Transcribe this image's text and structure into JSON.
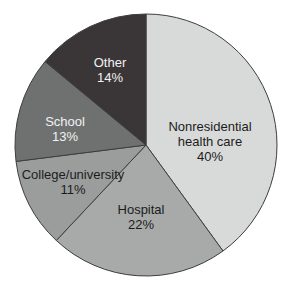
{
  "figure": {
    "kind": "pie-chart-figure",
    "background": "#ffffff"
  },
  "chart_data": {
    "type": "pie",
    "unit": "%",
    "direction": "clockwise",
    "start_angle_deg": 0,
    "legend": "none",
    "categories": [
      "Nonresidential health care",
      "Hospital",
      "College/university",
      "School",
      "Other"
    ],
    "values": [
      40,
      22,
      11,
      13,
      14
    ],
    "geometry": {
      "cx": 146,
      "cy": 145,
      "r": 131
    },
    "style": {
      "outline_color": "#3d3d3d",
      "outline_width": 1,
      "font_size": 13,
      "line_height": 15,
      "dark_text": "#1c1c1c",
      "light_text": "#f2f2f2"
    },
    "slices": [
      {
        "label": "Nonresidential health care",
        "value": 40,
        "display": "40%",
        "lines": [
          "Nonresidential",
          "health care",
          "40%"
        ],
        "color": "#d8dad9",
        "text_color": "#1c1c1c",
        "label_x": 210,
        "label_y": 131
      },
      {
        "label": "Hospital",
        "value": 22,
        "display": "22%",
        "lines": [
          "Hospital",
          "22%"
        ],
        "color": "#a8aaa9",
        "text_color": "#1c1c1c",
        "label_x": 141,
        "label_y": 214
      },
      {
        "label": "College/university",
        "value": 11,
        "display": "11%",
        "lines": [
          "College/university",
          "11%"
        ],
        "color": "#9b9d9c",
        "text_color": "#1c1c1c",
        "label_x": 73,
        "label_y": 179
      },
      {
        "label": "School",
        "value": 13,
        "display": "13%",
        "lines": [
          "School",
          "13%"
        ],
        "color": "#6f7171",
        "text_color": "#f2f2f2",
        "label_x": 65,
        "label_y": 126
      },
      {
        "label": "Other",
        "value": 14,
        "display": "14%",
        "lines": [
          "Other",
          "14%"
        ],
        "color": "#3a3536",
        "text_color": "#f2f2f2",
        "label_x": 110,
        "label_y": 67
      }
    ]
  }
}
